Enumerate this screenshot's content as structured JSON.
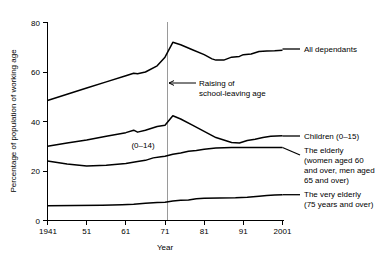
{
  "chart_data": {
    "type": "line",
    "title": "",
    "xlabel": "Year",
    "ylabel": "Percentage of population of working age",
    "xlim": [
      1941,
      2001
    ],
    "ylim": [
      0,
      80
    ],
    "xticks": [
      1941,
      1951,
      1961,
      1971,
      1981,
      1991,
      2001
    ],
    "xtick_labels": [
      "1941",
      "51",
      "61",
      "71",
      "81",
      "91",
      "2001"
    ],
    "yticks": [
      0,
      20,
      40,
      60,
      80
    ],
    "ytick_labels": [
      "0",
      "20",
      "40",
      "60",
      "80"
    ],
    "grid": false,
    "legend_position": "right-inline-labels",
    "series": [
      {
        "name": "All dependants",
        "label": "All dependants",
        "x": [
          1941,
          1946,
          1951,
          1956,
          1961,
          1963,
          1964,
          1966,
          1969,
          1971,
          1973,
          1975,
          1978,
          1981,
          1983,
          1984,
          1986,
          1988,
          1990,
          1991,
          1993,
          1995,
          1997,
          1999,
          2001
        ],
        "values": [
          48.5,
          51,
          53.5,
          56,
          58.5,
          59.5,
          59.3,
          60,
          62.5,
          66,
          72,
          71,
          69,
          67,
          65.3,
          64.8,
          64.8,
          66,
          66.3,
          67,
          67.3,
          68.3,
          68.5,
          68.6,
          68.8
        ]
      },
      {
        "name": "Children (0-15)",
        "label": "Children (0–15)",
        "x": [
          1941,
          1946,
          1951,
          1956,
          1961,
          1963,
          1964,
          1966,
          1968,
          1969,
          1971,
          1973,
          1975,
          1978,
          1981,
          1984,
          1986,
          1988,
          1990,
          1992,
          1994,
          1996,
          1998,
          2001
        ],
        "values": [
          30,
          31.3,
          32.5,
          34,
          35.5,
          36.5,
          35.7,
          36.5,
          37.5,
          38,
          38.5,
          42.3,
          41,
          38.5,
          36,
          33.5,
          32.5,
          31.5,
          31.3,
          32.3,
          32.8,
          33.5,
          34,
          34.2
        ]
      },
      {
        "name": "The elderly",
        "label": "The elderly (women aged 60 and over, men aged 65 and over)",
        "label_lines": [
          "The elderly",
          "(women aged 60",
          "and over, men aged",
          "65 and over)"
        ],
        "x": [
          1941,
          1946,
          1951,
          1956,
          1961,
          1964,
          1966,
          1968,
          1970,
          1971,
          1973,
          1975,
          1977,
          1979,
          1981,
          1984,
          1988,
          1992,
          1996,
          2001
        ],
        "values": [
          24,
          22.8,
          22,
          22.3,
          23,
          23.8,
          24.3,
          25.3,
          25.8,
          26,
          26.8,
          27.3,
          28,
          28.3,
          28.8,
          29.3,
          29.5,
          29.5,
          29.5,
          29.5
        ]
      },
      {
        "name": "The very elderly",
        "label": "The very elderly (75 years and over)",
        "label_lines": [
          "The very elderly",
          "(75 years and over)"
        ],
        "x": [
          1941,
          1948,
          1955,
          1960,
          1963,
          1966,
          1969,
          1971,
          1973,
          1975,
          1977,
          1979,
          1981,
          1985,
          1989,
          1992,
          1995,
          1997,
          1999,
          2001
        ],
        "values": [
          6,
          6.1,
          6.2,
          6.4,
          6.6,
          7.0,
          7.3,
          7.4,
          7.9,
          8.2,
          8.3,
          8.8,
          9.0,
          9.1,
          9.2,
          9.4,
          9.8,
          10.1,
          10.3,
          10.4
        ]
      }
    ],
    "annotations": [
      {
        "name": "school-leaving-age",
        "lines": [
          "Raising of",
          "school-leaving age"
        ],
        "target_year": 1972,
        "value": 53
      },
      {
        "name": "children-age-range-note",
        "text": "(0–14)",
        "year": 1966,
        "value": 35.5
      }
    ],
    "reference_line": {
      "name": "raising-of-school-leaving-age",
      "year": 1972,
      "color": "#9a9a9a"
    }
  },
  "colors": {
    "line": "#000000",
    "reference_line": "#9a9a9a",
    "background": "#ffffff"
  }
}
